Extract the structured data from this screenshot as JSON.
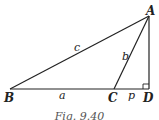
{
  "figure": {
    "caption": "Fig. 9.40",
    "points": {
      "A": {
        "label": "A",
        "x": 149,
        "y": 16
      },
      "B": {
        "label": "B",
        "x": 10,
        "y": 89
      },
      "C": {
        "label": "C",
        "x": 114,
        "y": 89
      },
      "D": {
        "label": "D",
        "x": 149,
        "y": 89
      }
    },
    "segments": [
      {
        "from": "B",
        "to": "A",
        "label": "c"
      },
      {
        "from": "C",
        "to": "A",
        "label": "b"
      },
      {
        "from": "B",
        "to": "C",
        "label": "a"
      },
      {
        "from": "C",
        "to": "D",
        "label": "p"
      },
      {
        "from": "A",
        "to": "D",
        "label": ""
      }
    ],
    "right_angle_at": "D",
    "labels": {
      "A": "A",
      "B": "B",
      "C": "C",
      "D": "D",
      "a": "a",
      "b": "b",
      "c": "c",
      "p": "p"
    }
  }
}
